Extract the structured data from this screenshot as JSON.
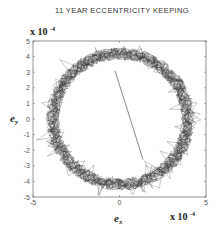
{
  "chart_data": {
    "type": "scatter",
    "title": "11  YEAR  ECCENTRICITY KEEPING",
    "xlabel": "e",
    "xlabel_sub": "x",
    "ylabel": "e",
    "ylabel_sub": "y",
    "x_multiplier": "x 10",
    "x_multiplier_exp": "-4",
    "y_multiplier": "x 10",
    "y_multiplier_exp": "-4",
    "xlim": [
      -5,
      5
    ],
    "ylim": [
      -5,
      5
    ],
    "x_ticks": [
      "-5",
      "0",
      "5"
    ],
    "y_ticks": [
      "5",
      "4",
      "3",
      "2",
      "1",
      "0",
      "-1",
      "-2",
      "-3",
      "-4",
      "-5"
    ],
    "grid": false,
    "ring": {
      "center": [
        0.05,
        0.0
      ],
      "radius_x": 3.9,
      "radius_y": 4.2,
      "band_width": 0.8
    },
    "transfer_line": {
      "x": [
        -0.26,
        1.36
      ],
      "y": [
        3.1,
        -2.6
      ]
    }
  }
}
